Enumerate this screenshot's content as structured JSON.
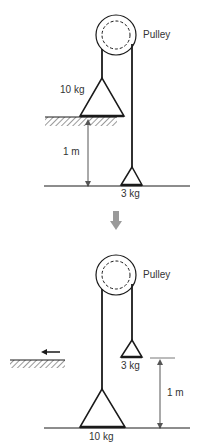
{
  "figure": {
    "colors": {
      "ink": "#1a1a1a",
      "label": "#333333",
      "transition_arrow": "#9a9a9a",
      "hatch": "#555555"
    },
    "before": {
      "pulley_label": "Pulley",
      "heavy_mass_label": "10 kg",
      "light_mass_label": "3 kg",
      "height_label": "1 m"
    },
    "transition": {
      "icon": "down-arrow-icon"
    },
    "after": {
      "pulley_label": "Pulley",
      "heavy_mass_label": "10 kg",
      "light_mass_label": "3 kg",
      "height_label": "1 m",
      "shelf_motion_icon": "left-arrow-icon"
    }
  }
}
